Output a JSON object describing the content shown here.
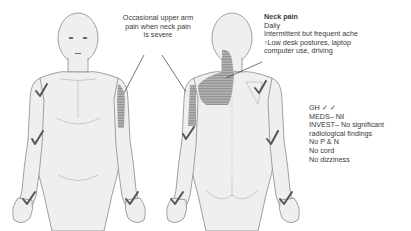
{
  "colors": {
    "skin": "#efefef",
    "outline": "#8a8a8a",
    "shading": "#9a9a9a",
    "check": "#555555",
    "text": "#3a3a3a"
  },
  "annotations": {
    "arm_pain": {
      "line1": "Occasional upper arm",
      "line2": "pain when neck pain",
      "line3": "is severe"
    },
    "neck_pain": {
      "title": "Neck pain",
      "line1": "Daily",
      "line2": "Intermittent but frequent ache",
      "line3": "↑Low desk postures, laptop",
      "line4": "computer use, driving"
    },
    "notes": {
      "gh": "GH ✓ ✓",
      "meds": "MEDS– Nil",
      "invest1": "INVEST– No significant",
      "invest2": "radiological findings",
      "pn": "No P & N",
      "cord": "No cord",
      "dizziness": "No dizziness"
    }
  },
  "figures": [
    {
      "view": "anterior",
      "shaded_areas": [
        "right upper arm (lateral)"
      ],
      "checked_areas": [
        "right shoulder",
        "right elbow",
        "right hand",
        "left hand"
      ]
    },
    {
      "view": "posterior",
      "shaded_areas": [
        "neck",
        "right upper trapezius / scapular area",
        "left upper arm (lateral)"
      ],
      "checked_areas": [
        "right shoulder",
        "left elbow",
        "right elbow",
        "left hand",
        "right hand"
      ]
    }
  ]
}
